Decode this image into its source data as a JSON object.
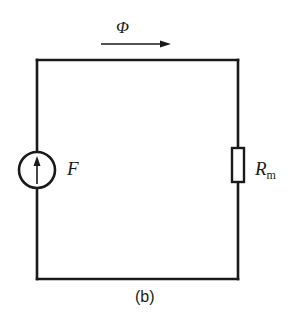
{
  "diagram": {
    "caption": "(b)",
    "flux": {
      "symbol": "Φ",
      "direction": "right"
    },
    "source": {
      "symbol": "F",
      "type": "mmf-source",
      "arrow": "up"
    },
    "resistor": {
      "symbol": "R",
      "subscript": "m",
      "type": "reluctance"
    },
    "colors": {
      "line": "#1a1a1a",
      "background": "#ffffff"
    }
  }
}
